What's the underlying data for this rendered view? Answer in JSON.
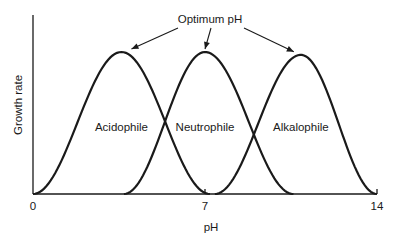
{
  "chart_data": {
    "type": "line",
    "title": "",
    "xlabel": "pH",
    "ylabel": "Growth rate",
    "xlim": [
      0,
      14
    ],
    "ylim": [
      0,
      1.15
    ],
    "x_ticks": [
      0,
      7,
      14
    ],
    "x_tick_labels": [
      "0",
      "7",
      "14"
    ],
    "y_ticks": [],
    "grid": false,
    "legend": "none",
    "annotation": {
      "text": "Optimum pH",
      "arrows_to_peaks": true
    },
    "series": [
      {
        "name": "Acidophile",
        "start_pH": 0.0,
        "optimum_pH": 3.6,
        "end_pH": 7.2,
        "peak_rate": 1.0
      },
      {
        "name": "Neutrophile",
        "start_pH": 3.7,
        "optimum_pH": 7.0,
        "end_pH": 10.6,
        "peak_rate": 1.0
      },
      {
        "name": "Alkalophile",
        "start_pH": 7.4,
        "optimum_pH": 10.9,
        "end_pH": 14.0,
        "peak_rate": 0.98
      }
    ],
    "series_labels": [
      "Acidophile",
      "Neutrophile",
      "Alkalophile"
    ],
    "colors": {
      "line": "#1a1a1a",
      "background": "#ffffff"
    }
  }
}
